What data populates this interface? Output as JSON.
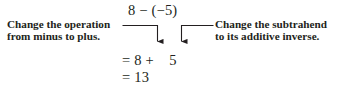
{
  "figure": {
    "background_color": "#ffffff",
    "ink_color": "#231f20"
  },
  "expressions": {
    "top": "8 − (−5)",
    "step": "= 8 +    5",
    "result": "= 13"
  },
  "annotations": {
    "left": {
      "line1": "Change the operation",
      "line2": "from minus to plus."
    },
    "right": {
      "line1": "Change the subtrahend",
      "line2": "to its additive inverse."
    }
  },
  "connectors": [
    {
      "name": "left-elbow-arrow",
      "points_to": "plus-sign",
      "direction": "down"
    },
    {
      "name": "right-elbow-arrow",
      "points_to": "five",
      "direction": "down"
    }
  ]
}
